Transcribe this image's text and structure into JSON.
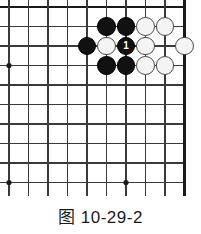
{
  "figure": {
    "caption": "图 10-29-2",
    "kind": "go-board-diagram"
  },
  "board": {
    "columns": 10,
    "rows": 10,
    "origin_x": 9,
    "origin_y": 7,
    "cell_size": 19.5,
    "line_color": "#3a3a3a",
    "edge_color": "#1a1a1a",
    "line_width": 1.1,
    "edge_width": 2.6,
    "background": "#ffffff",
    "top_edge_is_border": true,
    "right_edge_is_border": true,
    "star_points": [
      {
        "col": 0,
        "row": 3
      },
      {
        "col": 0,
        "row": 9
      },
      {
        "col": 6,
        "row": 9
      }
    ],
    "star_radius": 2.6,
    "star_color": "#1a1a1a"
  },
  "stones": {
    "radius": 9.3,
    "black_color": "#111111",
    "white_color": "#f4f4f4",
    "white_border": "#4a4a4a",
    "items": [
      {
        "id": "b-c5r1",
        "color": "black",
        "col": 5,
        "row": 1,
        "label": ""
      },
      {
        "id": "b-c6r1",
        "color": "black",
        "col": 6,
        "row": 1,
        "label": ""
      },
      {
        "id": "w-c7r1",
        "color": "white",
        "col": 7,
        "row": 1,
        "label": ""
      },
      {
        "id": "w-c8r1",
        "color": "white",
        "col": 8,
        "row": 1,
        "label": ""
      },
      {
        "id": "b-c4r2",
        "color": "black",
        "col": 4,
        "row": 2,
        "label": ""
      },
      {
        "id": "w-c5r2",
        "color": "white",
        "col": 5,
        "row": 2,
        "label": ""
      },
      {
        "id": "b-c6r2",
        "color": "black",
        "col": 6,
        "row": 2,
        "label": "1"
      },
      {
        "id": "w-c7r2",
        "color": "white",
        "col": 7,
        "row": 2,
        "label": ""
      },
      {
        "id": "w-c9r2",
        "color": "white",
        "col": 9,
        "row": 2,
        "label": ""
      },
      {
        "id": "b-c5r3",
        "color": "black",
        "col": 5,
        "row": 3,
        "label": ""
      },
      {
        "id": "b-c6r3",
        "color": "black",
        "col": 6,
        "row": 3,
        "label": ""
      },
      {
        "id": "w-c7r3",
        "color": "white",
        "col": 7,
        "row": 3,
        "label": ""
      },
      {
        "id": "w-c8r3",
        "color": "white",
        "col": 8,
        "row": 3,
        "label": ""
      }
    ]
  }
}
